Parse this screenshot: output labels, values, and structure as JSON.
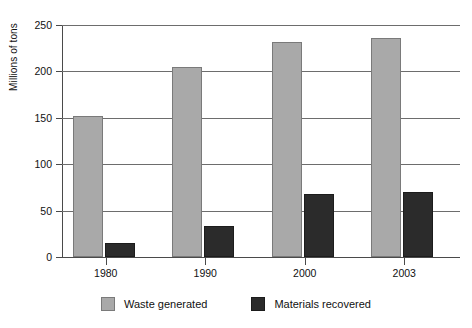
{
  "chart_data": {
    "type": "bar",
    "title": "",
    "subtitle": "",
    "xlabel": "",
    "ylabel": "Millions of tons",
    "categories": [
      "1980",
      "1990",
      "2000",
      "2003"
    ],
    "series": [
      {
        "name": "Waste generated",
        "color": "#a9a9a9",
        "values": [
          152,
          205,
          232,
          236
        ]
      },
      {
        "name": "Materials recovered",
        "color": "#2b2b2b",
        "values": [
          15,
          33,
          68,
          70
        ]
      }
    ],
    "ylim": [
      0,
      250
    ],
    "yticks": [
      0,
      50,
      100,
      150,
      200,
      250
    ],
    "ytick_labels": [
      "0",
      "50",
      "100",
      "150",
      "200",
      "250"
    ],
    "grid": true,
    "grid_axis": "y",
    "legend_position": "bottom",
    "annotations": []
  },
  "legend": {
    "entries": [
      {
        "label": "Waste generated",
        "swatch": "gray-swatch-icon"
      },
      {
        "label": "Materials recovered",
        "swatch": "dark-swatch-icon"
      }
    ]
  }
}
